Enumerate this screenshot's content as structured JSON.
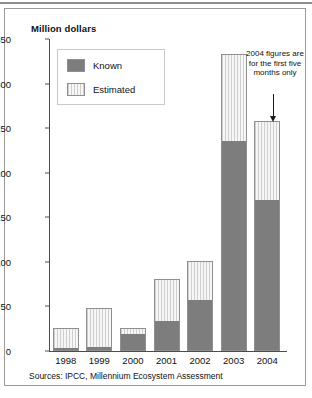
{
  "figure": {
    "axis_title": "Million dollars",
    "source_note": "Sources: IPCC, Millennium Ecosystem Assessment",
    "annotation": "2004 figures are for the first five months only"
  },
  "legend": {
    "items": [
      {
        "label": "Known",
        "color": "#7d7d7d",
        "swatch": "solid"
      },
      {
        "label": "Estimated",
        "color": "#cfcfcf",
        "swatch": "striped"
      }
    ]
  },
  "chart_data": {
    "type": "bar",
    "stacked": true,
    "title": "Million dollars",
    "xlabel": "",
    "ylabel": "Million dollars",
    "ylim": [
      0,
      350
    ],
    "yticks": [
      0,
      50,
      100,
      150,
      200,
      250,
      300,
      350
    ],
    "ytick_labels": [
      "0",
      "50",
      "100",
      "150",
      "200",
      "250",
      "300",
      "350"
    ],
    "grid": false,
    "legend_position": "upper-left",
    "categories": [
      "1998",
      "1999",
      "2000",
      "2001",
      "2002",
      "2003",
      "2004"
    ],
    "series": [
      {
        "name": "Known",
        "color": "#7d7d7d",
        "values": [
          2,
          4,
          20,
          33,
          57,
          236,
          170
        ]
      },
      {
        "name": "Estimated",
        "color": "#cfcfcf",
        "values": [
          24,
          44,
          6,
          48,
          44,
          97,
          88
        ]
      }
    ],
    "totals": [
      26,
      48,
      26,
      81,
      101,
      333,
      258
    ],
    "annotations": [
      {
        "text": "2004 figures are for the first five months only",
        "target_category": "2004"
      }
    ],
    "source": "Sources: IPCC, Millennium Ecosystem Assessment"
  }
}
